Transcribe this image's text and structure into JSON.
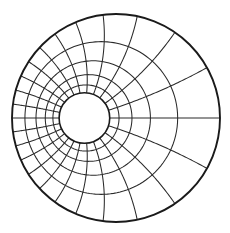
{
  "figure": {
    "outer_circle": {
      "cx": 116,
      "cy": 118,
      "r": 104
    },
    "inner_circle": {
      "cx": 85,
      "cy": 114,
      "r": 25
    },
    "rays_count": 24,
    "intermediate_rings_count": 4,
    "line_color": "#2a2a2a",
    "boundary_color": "#1a1a1a",
    "background": "#ffffff"
  }
}
